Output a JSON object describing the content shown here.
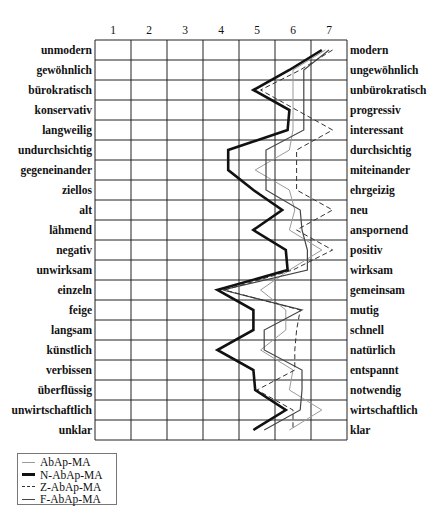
{
  "chart_data": {
    "type": "line",
    "title": "",
    "orientation": "horizontal-profile",
    "xlabel": "",
    "ylabel": "",
    "x_ticks": [
      "1",
      "2",
      "3",
      "4",
      "5",
      "6",
      "7"
    ],
    "xlim": [
      1,
      7
    ],
    "grid": true,
    "left_labels": [
      "unmodern",
      "gewöhnlich",
      "bürokratisch",
      "konservativ",
      "langweilig",
      "undurchsichtig",
      "gegeneinander",
      "ziellos",
      "alt",
      "lähmend",
      "negativ",
      "unwirksam",
      "einzeln",
      "feige",
      "langsam",
      "künstlich",
      "verbissen",
      "überflüssig",
      "unwirtschaftlich",
      "unklar"
    ],
    "right_labels": [
      "modern",
      "ungewöhnlich",
      "unbürokratisch",
      "progressiv",
      "interessant",
      "durchsichtig",
      "miteinander",
      "ehrgeizig",
      "neu",
      "anspornend",
      "positiv",
      "wirksam",
      "gemeinsam",
      "mutig",
      "schnell",
      "natürlich",
      "entspannt",
      "notwendig",
      "wirtschaftlich",
      "klar"
    ],
    "legend_position": "bottom-left",
    "series": [
      {
        "name": "AbAp-MA",
        "style": "thin-light",
        "color": "#9a9a9a",
        "values": [
          6.9,
          6.0,
          6.0,
          6.0,
          6.0,
          5.9,
          4.95,
          5.9,
          6.05,
          5.9,
          6.8,
          5.9,
          5.1,
          5.8,
          5.8,
          5.1,
          6.0,
          5.9,
          6.8,
          5.9
        ]
      },
      {
        "name": "N-AbAp-MA",
        "style": "thick",
        "color": "#111111",
        "values": [
          6.8,
          5.9,
          4.9,
          5.9,
          5.85,
          4.2,
          4.2,
          4.9,
          5.7,
          4.9,
          5.8,
          5.85,
          3.9,
          4.9,
          4.9,
          3.9,
          4.9,
          4.95,
          5.8,
          4.9
        ]
      },
      {
        "name": "Z-AbAp-MA",
        "style": "dashed",
        "color": "#333333",
        "values": [
          7.1,
          6.2,
          5.1,
          6.1,
          7.1,
          6.1,
          6.1,
          6.1,
          7.1,
          6.1,
          7.1,
          6.0,
          4.1,
          6.2,
          6.1,
          6.05,
          6.05,
          5.0,
          6.0,
          6.0
        ]
      },
      {
        "name": "F-AbAp-MA",
        "style": "thin-dark",
        "color": "#444444",
        "values": [
          7.0,
          6.3,
          6.3,
          6.3,
          6.3,
          5.25,
          5.25,
          5.25,
          6.2,
          6.25,
          6.4,
          6.4,
          4.05,
          6.25,
          5.2,
          5.2,
          6.25,
          6.25,
          6.2,
          5.2
        ]
      }
    ]
  },
  "legend": {
    "items": [
      {
        "label": "AbAp-MA",
        "color": "#9a9a9a",
        "width": 1,
        "dash": "none"
      },
      {
        "label": "N-AbAp-MA",
        "color": "#111111",
        "width": 3,
        "dash": "none"
      },
      {
        "label": "Z-AbAp-MA",
        "color": "#333333",
        "width": 1,
        "dash": "dashed"
      },
      {
        "label": "F-AbAp-MA",
        "color": "#444444",
        "width": 1.2,
        "dash": "none"
      }
    ]
  }
}
